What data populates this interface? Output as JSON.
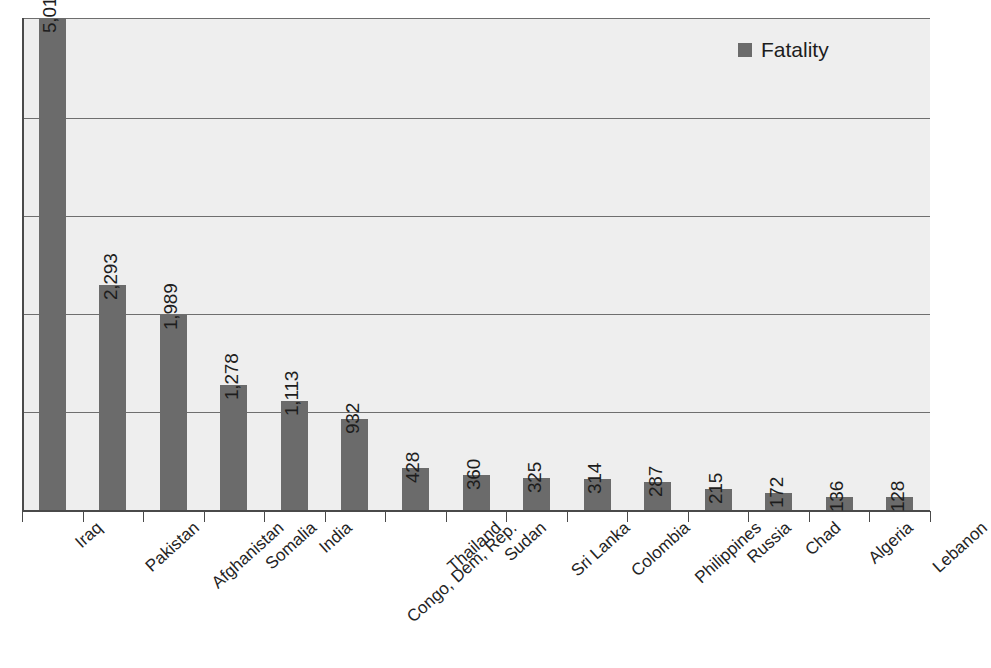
{
  "chart_data": {
    "type": "bar",
    "title": "",
    "subtitle": "",
    "xlabel": "",
    "ylabel": "",
    "ylim": [
      0,
      5016
    ],
    "grid": true,
    "gridlines": [
      1000,
      2000,
      3000,
      4000,
      5016
    ],
    "legend_position": "top-right",
    "orientation": "vertical",
    "categories": [
      "Iraq",
      "Pakistan",
      "Afghanistan",
      "Somalia",
      "India",
      "Congo, Dem, Rep.",
      "Thailand",
      "Sudan",
      "Sri Lanka",
      "Colombia",
      "Philippines",
      "Russia",
      "Chad",
      "Algeria",
      "Lebanon"
    ],
    "values": [
      5016,
      2293,
      1989,
      1278,
      1113,
      932,
      428,
      360,
      325,
      314,
      287,
      215,
      172,
      136,
      128
    ],
    "value_labels": [
      "5,016",
      "2,293",
      "1,989",
      "1,278",
      "1,113",
      "932",
      "428",
      "360",
      "325",
      "314",
      "287",
      "215",
      "172",
      "136",
      "128"
    ],
    "series": [
      {
        "name": "Fatality",
        "color": "#6b6b6b",
        "values": [
          5016,
          2293,
          1989,
          1278,
          1113,
          932,
          428,
          360,
          325,
          314,
          287,
          215,
          172,
          136,
          128
        ]
      }
    ]
  },
  "legend": {
    "entries": [
      {
        "label": "Fatality",
        "color": "#6b6b6b"
      }
    ]
  },
  "colors": {
    "bar": "#6b6b6b",
    "plot_background": "#eeeeee",
    "axis": "#4a4a4a",
    "gridline": "#6e6e6e",
    "text": "#1d1d1d"
  }
}
